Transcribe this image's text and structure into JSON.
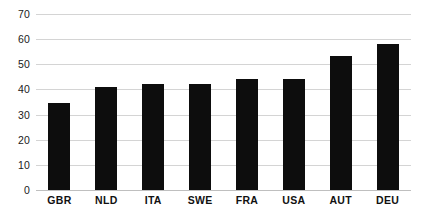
{
  "chart_data": {
    "type": "bar",
    "title": "",
    "subtitle": "",
    "xlabel": "",
    "ylabel": "",
    "categories": [
      "GBR",
      "NLD",
      "ITA",
      "SWE",
      "FRA",
      "USA",
      "AUT",
      "DEU"
    ],
    "values": [
      34.5,
      41,
      42,
      42,
      44,
      44,
      53.5,
      58
    ],
    "series": [
      {
        "name": "",
        "values": [
          34.5,
          41,
          42,
          42,
          44,
          44,
          53.5,
          58
        ]
      }
    ],
    "ylim": [
      0,
      70
    ],
    "ytick_labels": [
      "0",
      "10",
      "20",
      "30",
      "40",
      "50",
      "60",
      "70"
    ],
    "ytick_values": [
      0,
      10,
      20,
      30,
      40,
      50,
      60,
      70
    ],
    "grid": true,
    "grid_axis": "y",
    "legend": false,
    "legend_position": "none",
    "bar_color": "#0d0d0d",
    "gridline_color": "#d4d4d4",
    "background_color": "#ffffff",
    "annotations": []
  }
}
